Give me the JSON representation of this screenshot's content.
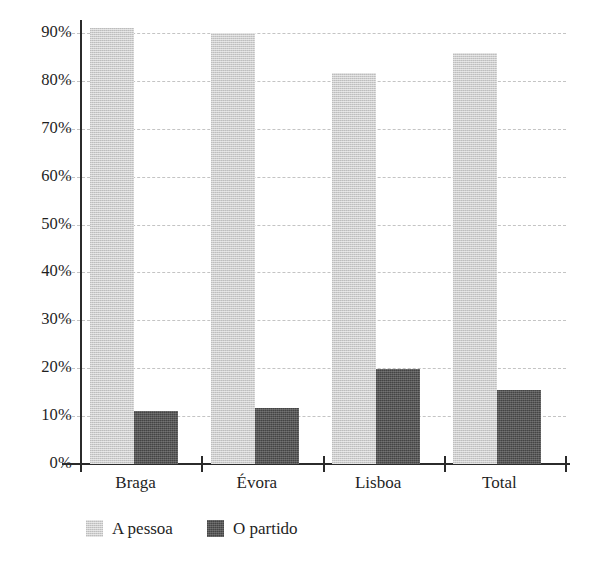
{
  "chart_data": {
    "type": "bar",
    "title": "",
    "subtitle": "",
    "xlabel": "",
    "ylabel": "",
    "categories": [
      "Braga",
      "Évora",
      "Lisboa",
      "Total"
    ],
    "series": [
      {
        "name": "A pessoa",
        "color": "#cdcdcd",
        "values": [
          91,
          90,
          81.6,
          85.9
        ]
      },
      {
        "name": "O partido",
        "color": "#575757",
        "values": [
          11,
          11.8,
          19.8,
          15.5
        ]
      }
    ],
    "ylim": [
      0,
      95
    ],
    "y_ticks": [
      0,
      10,
      20,
      30,
      40,
      50,
      60,
      70,
      80,
      90
    ],
    "y_tick_labels": [
      "0%",
      "10%",
      "20%",
      "30%",
      "40%",
      "50%",
      "60%",
      "70%",
      "80%",
      "90%"
    ],
    "grid": true,
    "grid_axis": "y",
    "grid_style": "dashed",
    "grid_color": "#c4c4c4",
    "legend_position": "bottom-left",
    "axis_color": "#2b2b2b",
    "background": "#ffffff"
  },
  "legend": {
    "items": [
      {
        "label": "A pessoa",
        "color": "#cdcdcd"
      },
      {
        "label": "O partido",
        "color": "#575757"
      }
    ]
  },
  "footnote": {
    "text": ""
  }
}
